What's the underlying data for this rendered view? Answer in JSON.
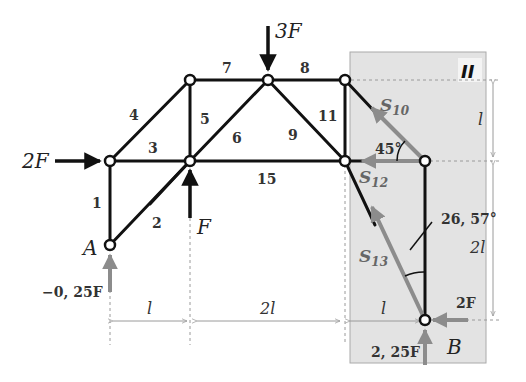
{
  "diagram": {
    "type": "truss-section-method",
    "section_label": "II",
    "members": [
      {
        "id": "1",
        "label": "1"
      },
      {
        "id": "2",
        "label": "2"
      },
      {
        "id": "3",
        "label": "3"
      },
      {
        "id": "4",
        "label": "4"
      },
      {
        "id": "5",
        "label": "5"
      },
      {
        "id": "6",
        "label": "6"
      },
      {
        "id": "7",
        "label": "7"
      },
      {
        "id": "8",
        "label": "8"
      },
      {
        "id": "9",
        "label": "9"
      },
      {
        "id": "11",
        "label": "11"
      },
      {
        "id": "15",
        "label": "15"
      }
    ],
    "supports": {
      "A": {
        "label": "A",
        "reaction": "−0, 25F"
      },
      "B": {
        "label": "B",
        "reaction_vertical": "2, 25F",
        "reaction_horizontal": "2F"
      }
    },
    "loads": {
      "top": "3F",
      "left": "2F",
      "bottom_inner": "F"
    },
    "section_forces": {
      "s10": {
        "base": "S",
        "sub": "10"
      },
      "s12": {
        "base": "S",
        "sub": "12"
      },
      "s13": {
        "base": "S",
        "sub": "13"
      }
    },
    "angles": {
      "a45": "45°",
      "a2657": "26, 57°"
    },
    "dimensions": {
      "horizontal": [
        "l",
        "2l",
        "l"
      ],
      "vertical": [
        "l",
        "2l"
      ]
    },
    "colors": {
      "member": "#111111",
      "panel": "#e3e3e3",
      "force_gray": "#8c8c8c",
      "dim_line": "#9a9a9a"
    }
  }
}
